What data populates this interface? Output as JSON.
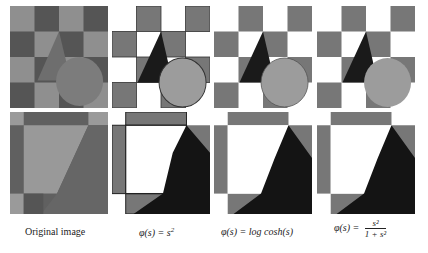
{
  "figure": {
    "columns": [
      {
        "id": "original",
        "caption": "Original image"
      },
      {
        "id": "quadratic",
        "caption_prefix": "φ(s) = s",
        "caption_sup": "2"
      },
      {
        "id": "logcosh",
        "caption": "φ(s) = log cosh(s)"
      },
      {
        "id": "geman",
        "caption_prefix": "φ(s) =",
        "caption_num": "s²",
        "caption_den": "1 + s²"
      }
    ],
    "rows": [
      {
        "id": "full-view",
        "description": "checkerboard with triangle and circle"
      },
      {
        "id": "zoomed-view",
        "description": "zoomed detail of triangle region"
      }
    ]
  },
  "colors": {
    "background": "#ffffff",
    "checker_light": "#9a9a9a",
    "checker_dark": "#555555",
    "restored_white": "#ffffff",
    "restored_gray": "#7a7a7a",
    "triangle_dark": "#1a1a1a",
    "circle_gray": "#9c9c9c"
  }
}
